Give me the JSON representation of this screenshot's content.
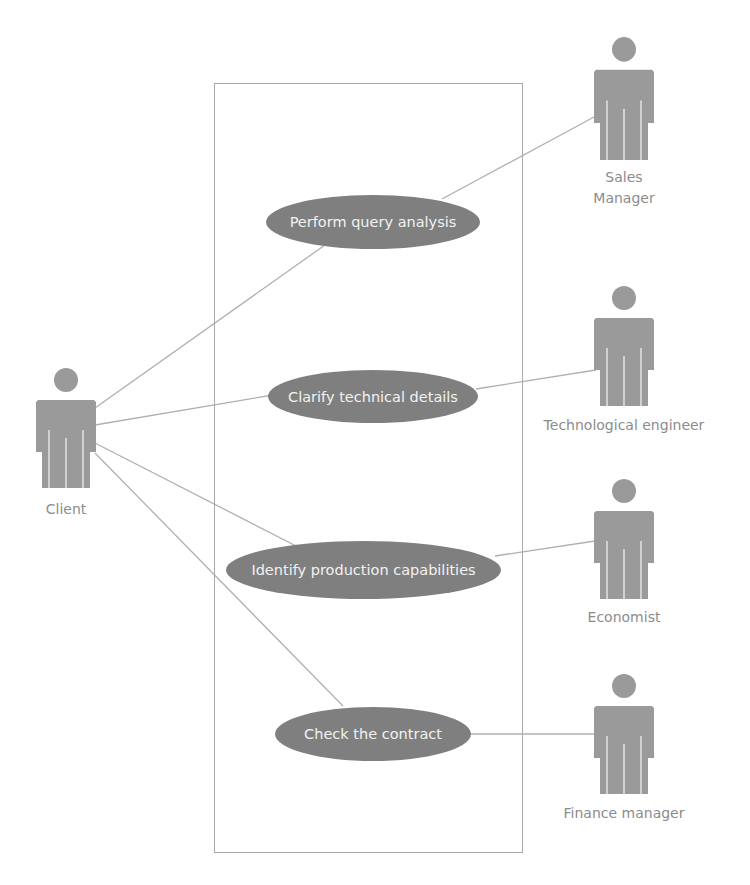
{
  "diagram": {
    "type": "use-case",
    "colors": {
      "usecase_fill": "#7f7f7f",
      "usecase_text": "#f2f2f2",
      "actor_fill": "#9a9a9a",
      "actor_label": "#8c8c8c",
      "line": "#b0b0b0",
      "boundary": "#a9a9a9"
    },
    "use_cases": [
      {
        "id": "uc1",
        "label": "Perform query analysis"
      },
      {
        "id": "uc2",
        "label": "Clarify technical details"
      },
      {
        "id": "uc3",
        "label": "Identify production capabilities"
      },
      {
        "id": "uc4",
        "label": "Check the contract"
      }
    ],
    "actors": [
      {
        "id": "client",
        "label": "Client"
      },
      {
        "id": "sales",
        "label_line1": "Sales",
        "label_line2": "Manager"
      },
      {
        "id": "tech",
        "label": "Technological engineer"
      },
      {
        "id": "econ",
        "label": "Economist"
      },
      {
        "id": "finance",
        "label": "Finance manager"
      }
    ],
    "associations": [
      {
        "from": "Client",
        "to": "Perform query analysis"
      },
      {
        "from": "Client",
        "to": "Clarify technical details"
      },
      {
        "from": "Client",
        "to": "Identify production capabilities"
      },
      {
        "from": "Client",
        "to": "Check the contract"
      },
      {
        "from": "Sales Manager",
        "to": "Perform query analysis"
      },
      {
        "from": "Technological engineer",
        "to": "Clarify technical details"
      },
      {
        "from": "Economist",
        "to": "Identify production capabilities"
      },
      {
        "from": "Finance manager",
        "to": "Check the contract"
      }
    ]
  }
}
